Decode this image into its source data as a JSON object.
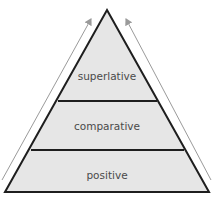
{
  "diagram": {
    "type": "pyramid",
    "levels": [
      {
        "label": "superlative"
      },
      {
        "label": "comparative"
      },
      {
        "label": "positive"
      }
    ],
    "colors": {
      "fill": "#e6e6e6",
      "outline": "#1e1e1e",
      "arrow": "#9a9a9a",
      "text": "#4a4a4a"
    }
  }
}
